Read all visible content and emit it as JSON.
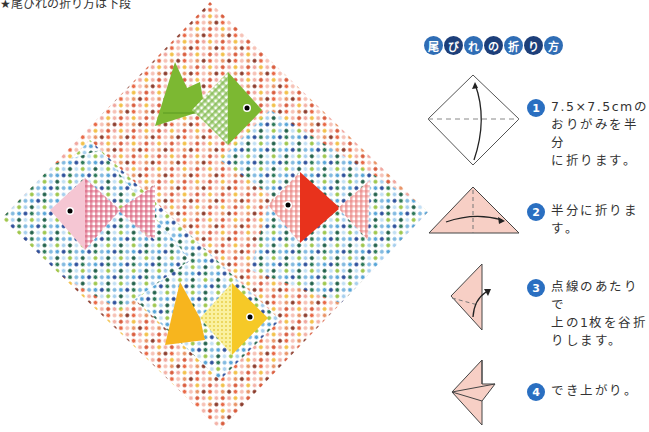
{
  "caption": "★尾びれの折り方は下段",
  "title": {
    "chars": [
      "尾",
      "び",
      "れ",
      "の",
      "折",
      "り",
      "方"
    ]
  },
  "steps": [
    {
      "number": "1",
      "text_lines": [
        "7.5×7.5cmの",
        "おりがみを半分",
        "に折ります。"
      ]
    },
    {
      "number": "2",
      "text_lines": [
        "半分に折ります。"
      ]
    },
    {
      "number": "3",
      "text_lines": [
        "点線のあたりで",
        "上の1枚を谷折",
        "りします。"
      ]
    },
    {
      "number": "4",
      "text_lines": [
        "でき上がり。"
      ]
    }
  ],
  "photo": {
    "description": "polka-dot origami paper diamond with four origami fish",
    "fish": [
      {
        "color": "green",
        "body": "#7cb832",
        "pattern": "gingham-green"
      },
      {
        "color": "pink",
        "body": "#f5c6d3",
        "pattern": "gingham-pink"
      },
      {
        "color": "red",
        "body": "#e8321c",
        "pattern": "gingham-red"
      },
      {
        "color": "yellow",
        "body": "#f6c927",
        "pattern": "dots-yellow"
      }
    ]
  },
  "colors": {
    "badge": "#2a6fc1",
    "title_dark": "#1d3f7a",
    "diagram_fill": "#f7cfc5"
  }
}
